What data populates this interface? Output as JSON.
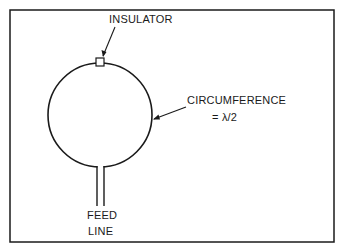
{
  "diagram": {
    "type": "loop-antenna",
    "labels": {
      "insulator": "INSULATOR",
      "circumference": "CIRCUMFERENCE",
      "circumference_value": "= λ/2",
      "feed_line_1": "FEED",
      "feed_line_2": "LINE"
    },
    "colors": {
      "stroke": "#1a1a1a",
      "background": "#ffffff"
    }
  }
}
